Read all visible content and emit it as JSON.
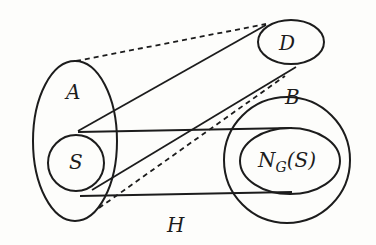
{
  "diagram": {
    "type": "set-graph-illustration",
    "labels": {
      "A": "A",
      "S": "S",
      "D": "D",
      "B": "B",
      "ngs_main": "N",
      "ngs_sub": "G",
      "ngs_arg": "(S)",
      "H": "H"
    },
    "sets": [
      {
        "id": "A",
        "shape": "ellipse",
        "contains": [
          "S"
        ]
      },
      {
        "id": "S",
        "shape": "circle",
        "inside": "A"
      },
      {
        "id": "D",
        "shape": "ellipse"
      },
      {
        "id": "B",
        "shape": "circle",
        "contains": [
          "N_G(S)"
        ]
      },
      {
        "id": "N_G(S)",
        "shape": "ellipse",
        "inside": "B"
      }
    ],
    "edges": [
      {
        "from": "S",
        "to": "N_G(S)",
        "style": "solid",
        "note": "upper tangent"
      },
      {
        "from": "S",
        "to": "N_G(S)",
        "style": "solid",
        "note": "lower tangent"
      },
      {
        "from": "S",
        "to": "D",
        "style": "solid"
      },
      {
        "from": "S",
        "to": "D",
        "style": "solid",
        "note": "to bottom of D via B"
      },
      {
        "from": "A",
        "to": "D",
        "style": "dashed"
      },
      {
        "from": "A",
        "to": "B",
        "style": "dashed"
      }
    ],
    "region_label": "H",
    "stroke_color": "#1c1c1c",
    "background": "#fdfdfb"
  }
}
